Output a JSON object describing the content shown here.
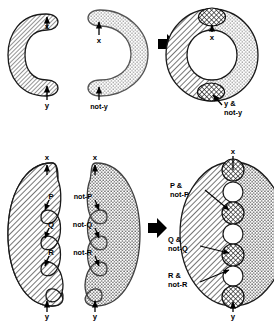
{
  "figure": {
    "rows": [
      {
        "name": "row-crescents",
        "panels": [
          {
            "name": "panel-x-y-crescent",
            "shape": "crescent-open-right",
            "fill": "diagonal-hatch",
            "labels": [
              {
                "text": "x",
                "position": "top"
              },
              {
                "text": "y",
                "position": "bottom"
              }
            ]
          },
          {
            "name": "panel-notx-noty-crescent",
            "shape": "crescent-open-left",
            "fill": "stipple",
            "labels": [
              {
                "text": "x",
                "position": "top"
              },
              {
                "text": "not-y",
                "position": "bottom"
              }
            ]
          },
          {
            "name": "panel-ring-combined",
            "shape": "annulus",
            "fill_left": "diagonal-hatch",
            "fill_right": "stipple",
            "overlap_fill": "cross-hatch",
            "labels": [
              {
                "text": "x",
                "position": "top"
              },
              {
                "text": "y &",
                "position": "bottom-line1"
              },
              {
                "text": "not-y",
                "position": "bottom-line2"
              }
            ]
          }
        ],
        "operator_icon": "right-arrow-icon"
      },
      {
        "name": "row-scalloped-ellipses",
        "panels": [
          {
            "name": "panel-pqr-half-ellipse",
            "shape": "half-ellipse-scalloped-right",
            "fill": "diagonal-hatch",
            "labels": [
              {
                "text": "x",
                "position": "top"
              },
              {
                "text": "P",
                "position": "notch-1"
              },
              {
                "text": "Q",
                "position": "notch-2"
              },
              {
                "text": "R",
                "position": "notch-3"
              },
              {
                "text": "y",
                "position": "bottom"
              }
            ]
          },
          {
            "name": "panel-notpqr-half-ellipse",
            "shape": "half-ellipse-scalloped-left",
            "fill": "stipple",
            "labels": [
              {
                "text": "x",
                "position": "top"
              },
              {
                "text": "not-P",
                "position": "notch-1"
              },
              {
                "text": "not-Q",
                "position": "notch-2"
              },
              {
                "text": "not-R",
                "position": "notch-3"
              },
              {
                "text": "y",
                "position": "bottom"
              }
            ]
          },
          {
            "name": "panel-ellipse-combined",
            "shape": "ellipse",
            "fill_left": "diagonal-hatch",
            "fill_right": "stipple",
            "overlap_fill": "cross-hatch",
            "labels": [
              {
                "text": "x",
                "position": "top"
              },
              {
                "text": "P &",
                "position": "callout-1-line1"
              },
              {
                "text": "not-P",
                "position": "callout-1-line2"
              },
              {
                "text": "Q &",
                "position": "callout-2-line1"
              },
              {
                "text": "not-Q",
                "position": "callout-2-line2"
              },
              {
                "text": "R &",
                "position": "callout-3-line1"
              },
              {
                "text": "not-R",
                "position": "callout-3-line2"
              },
              {
                "text": "y",
                "position": "bottom"
              }
            ],
            "overlap_circle_count": 5,
            "gap_circle_count": 4
          }
        ],
        "operator_icon": "right-arrow-icon"
      }
    ],
    "colors": {
      "stroke": "#000000",
      "fill_background": "#ffffff",
      "hatch": "#3a3a3a",
      "stipple": "#555555",
      "arrow": "#000000"
    }
  }
}
